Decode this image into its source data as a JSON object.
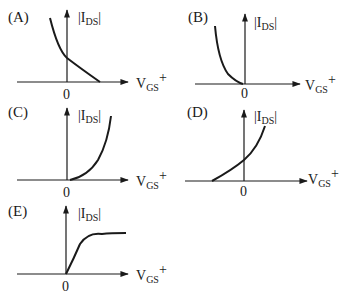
{
  "figure": {
    "y_axis_label": {
      "main": "|I",
      "sub": "DS",
      "end": "|"
    },
    "x_axis_label": {
      "main": "V",
      "sub": "GS",
      "sup": "+"
    },
    "origin_label": "0",
    "panels": [
      {
        "id": "A",
        "label": "(A)",
        "shape": "decreasing convex curve crossing y-axis, reaching zero at positive V_GS"
      },
      {
        "id": "B",
        "label": "(B)",
        "shape": "decreasing convex curve entirely at negative V_GS, reaching zero at origin"
      },
      {
        "id": "C",
        "label": "(C)",
        "shape": "increasing convex curve starting at origin into positive V_GS"
      },
      {
        "id": "D",
        "label": "(D)",
        "shape": "increasing convex curve starting at negative V_GS, crossing y-axis"
      },
      {
        "id": "E",
        "label": "(E)",
        "shape": "rising from origin then saturating to a plateau"
      }
    ]
  }
}
